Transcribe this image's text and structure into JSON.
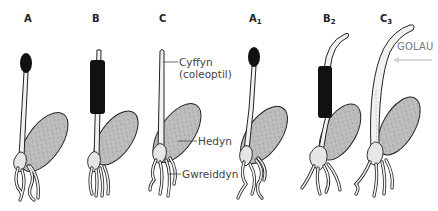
{
  "figure": {
    "colors": {
      "outline": "#222222",
      "cap": "#111111",
      "seed_fill": "#b8b8b8",
      "coleoptile_fill": "#f2f2f2",
      "annotation_text": "#444444",
      "light_text": "#777777",
      "light_arrow": "#cccccc"
    }
  },
  "panels": [
    {
      "id": "A",
      "label_main": "A",
      "label_sub": "",
      "treatment": "tip covered with black cap",
      "state": "before"
    },
    {
      "id": "B",
      "label_main": "B",
      "label_sub": "",
      "treatment": "lower coleoptile covered with black sleeve",
      "state": "before"
    },
    {
      "id": "C",
      "label_main": "C",
      "label_sub": "",
      "treatment": "uncovered",
      "state": "before"
    },
    {
      "id": "A1",
      "label_main": "A",
      "label_sub": "1",
      "treatment": "tip covered with black cap",
      "state": "after - straight"
    },
    {
      "id": "B2",
      "label_main": "B",
      "label_sub": "2",
      "treatment": "lower coleoptile covered with black sleeve",
      "state": "after - tip bent toward light"
    },
    {
      "id": "C3",
      "label_main": "C",
      "label_sub": "3",
      "treatment": "uncovered",
      "state": "after - bent toward light"
    }
  ],
  "annotations": {
    "coleoptile_line1": "Cyffyn",
    "coleoptile_line2": "(coleoptil)",
    "seed": "Hedyn",
    "roots": "Gwreiddyn"
  },
  "light": {
    "label": "GOLAU",
    "direction": "from right"
  }
}
